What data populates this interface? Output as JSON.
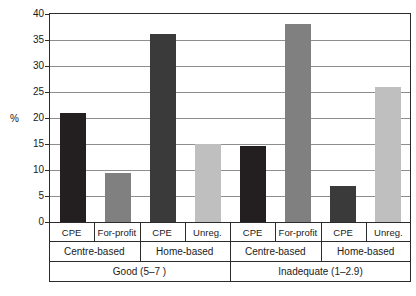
{
  "chart_data": {
    "type": "bar",
    "title": "",
    "subtitle": "",
    "xlabel": "",
    "ylabel": "%",
    "ylim": [
      0,
      40
    ],
    "ytick_step": 5,
    "ytick_labels": [
      "40",
      "35",
      "30",
      "25",
      "20",
      "15",
      "10",
      "5",
      "0"
    ],
    "ytick_values": [
      40,
      35,
      30,
      25,
      20,
      15,
      10,
      5,
      0
    ],
    "grid": true,
    "grid_axis": "y",
    "legend": false,
    "legend_position": "none",
    "categories": [
      "CPE",
      "For-profit",
      "CPE",
      "Unreg.",
      "CPE",
      "For-profit",
      "CPE",
      "Unreg."
    ],
    "values": [
      21,
      9.4,
      36.2,
      15,
      14.6,
      38,
      7,
      26
    ],
    "bar_colors": [
      "#231f20",
      "#808080",
      "#3a3a3a",
      "#bfbfbf",
      "#231f20",
      "#808080",
      "#3a3a3a",
      "#bfbfbf"
    ],
    "bars": [
      {
        "label": "CPE",
        "setting": "Centre-based",
        "quality": "Good (5–7 )",
        "value": 21,
        "color": "#231f20"
      },
      {
        "label": "For-profit",
        "setting": "Centre-based",
        "quality": "Good (5–7 )",
        "value": 9.4,
        "color": "#808080"
      },
      {
        "label": "CPE",
        "setting": "Home-based",
        "quality": "Good (5–7 )",
        "value": 36.2,
        "color": "#3a3a3a"
      },
      {
        "label": "Unreg.",
        "setting": "Home-based",
        "quality": "Good (5–7 )",
        "value": 15,
        "color": "#bfbfbf"
      },
      {
        "label": "CPE",
        "setting": "Centre-based",
        "quality": "Inadequate (1–2.9)",
        "value": 14.6,
        "color": "#231f20"
      },
      {
        "label": "For-profit",
        "setting": "Centre-based",
        "quality": "Inadequate (1–2.9)",
        "value": 38,
        "color": "#808080"
      },
      {
        "label": "CPE",
        "setting": "Home-based",
        "quality": "Inadequate (1–2.9)",
        "value": 7,
        "color": "#3a3a3a"
      },
      {
        "label": "Unreg.",
        "setting": "Home-based",
        "quality": "Inadequate (1–2.9)",
        "value": 26,
        "color": "#bfbfbf"
      }
    ],
    "group_tier2": [
      "Centre-based",
      "Home-based",
      "Centre-based",
      "Home-based"
    ],
    "group_tier3": [
      "Good (5–7 )",
      "Inadequate (1–2.9)"
    ]
  },
  "axis": {
    "y_title": "%",
    "ticks": [
      "40",
      "35",
      "30",
      "25",
      "20",
      "15",
      "10",
      "5",
      "0"
    ]
  },
  "xlabels_tier1": [
    "CPE",
    "For-profit",
    "CPE",
    "Unreg.",
    "CPE",
    "For-profit",
    "CPE",
    "Unreg."
  ],
  "xlabels_tier2": [
    "Centre-based",
    "Home-based",
    "Centre-based",
    "Home-based"
  ],
  "xlabels_tier3": [
    "Good (5–7 )",
    "Inadequate (1–2.9)"
  ],
  "colors": {
    "bar_dark": "#231f20",
    "bar_mid": "#808080",
    "bar_dark2": "#3a3a3a",
    "bar_light": "#bfbfbf",
    "axis": "#2b2b2b",
    "grid": "#8e8e8e",
    "background": "#ffffff"
  }
}
